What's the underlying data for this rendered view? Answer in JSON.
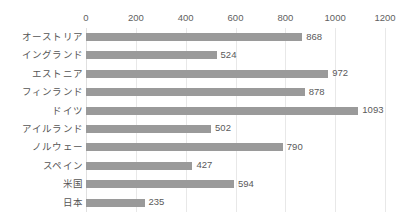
{
  "chart_data": {
    "type": "bar",
    "orientation": "horizontal",
    "title": "",
    "subtitle": "",
    "xlabel": "",
    "ylabel": "",
    "xlim": [
      0,
      1200
    ],
    "xticks": [
      0,
      200,
      400,
      600,
      800,
      1000,
      1200
    ],
    "xtick_labels": [
      "0",
      "200",
      "400",
      "600",
      "800",
      "1000",
      "1200"
    ],
    "grid": "vertical",
    "legend": "none",
    "bar_color": "#9a9a9a",
    "grid_color": "#e8e8e8",
    "text_color": "#555555",
    "background": "#ffffff",
    "show_data_labels": true,
    "categories": [
      "オーストリア",
      "イングランド",
      "エストニア",
      "フィンランド",
      "ドイツ",
      "アイルランド",
      "ノルウェー",
      "スペイン",
      "米国",
      "日本"
    ],
    "values": [
      868,
      524,
      972,
      878,
      1093,
      502,
      790,
      427,
      594,
      235
    ],
    "value_labels": [
      "868",
      "524",
      "972",
      "878",
      "1093",
      "502",
      "790",
      "427",
      "594",
      "235"
    ]
  }
}
